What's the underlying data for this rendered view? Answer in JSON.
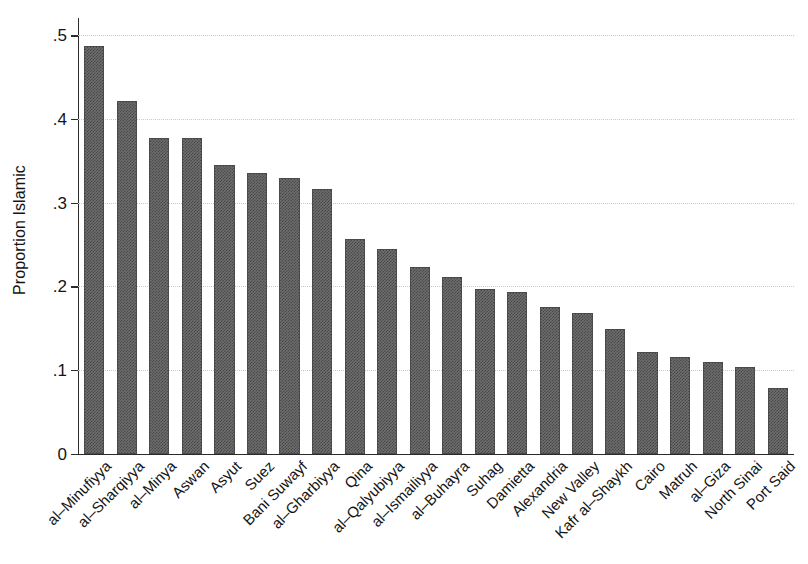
{
  "chart_data": {
    "type": "bar",
    "title": "",
    "xlabel": "",
    "ylabel": "Proportion Islamic",
    "ylim": [
      0,
      0.52
    ],
    "grid": true,
    "legend": "none",
    "orientation": "vertical",
    "bar_color": "#6e6e6e",
    "categories": [
      "al–Minufiyya",
      "al–Sharqiyya",
      "al–Minya",
      "Aswan",
      "Asyut",
      "Suez",
      "Bani Suwayf",
      "al–Gharbiyya",
      "Qina",
      "al–Qalyubiyya",
      "al–Ismailiyya",
      "al–Buhayra",
      "Suhag",
      "Damietta",
      "Alexandria",
      "New Valley",
      "Kafr al–Shaykh",
      "Cairo",
      "Matruh",
      "al–Giza",
      "North Sinai",
      "Port Said"
    ],
    "values": [
      0.487,
      0.421,
      0.377,
      0.377,
      0.345,
      0.336,
      0.329,
      0.316,
      0.257,
      0.245,
      0.223,
      0.211,
      0.197,
      0.193,
      0.175,
      0.168,
      0.149,
      0.122,
      0.115,
      0.109,
      0.104,
      0.079
    ],
    "yticks": [
      {
        "value": 0,
        "label": "0"
      },
      {
        "value": 0.1,
        "label": ".1"
      },
      {
        "value": 0.2,
        "label": ".2"
      },
      {
        "value": 0.3,
        "label": ".3"
      },
      {
        "value": 0.4,
        "label": ".4"
      },
      {
        "value": 0.5,
        "label": ".5"
      }
    ]
  }
}
